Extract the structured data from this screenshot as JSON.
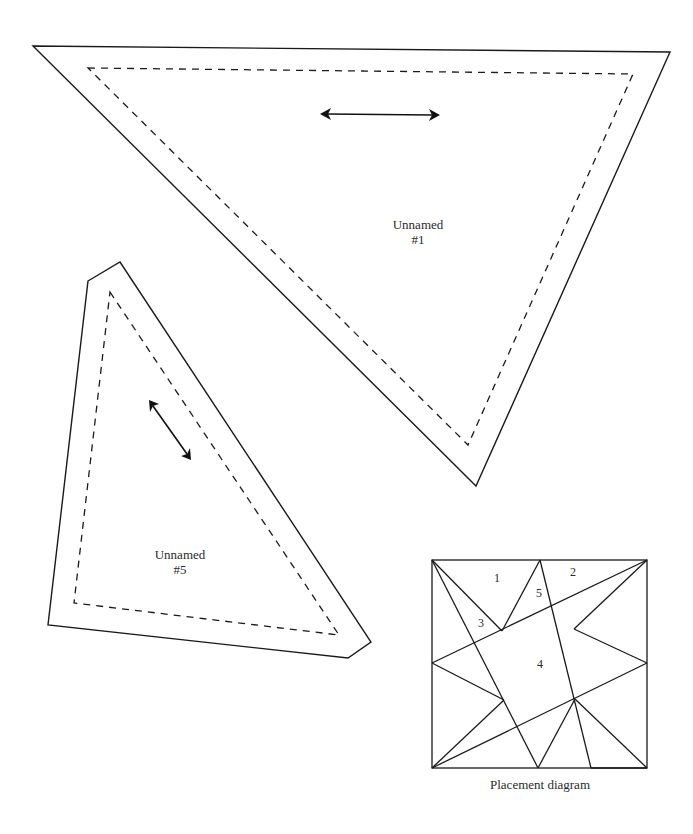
{
  "pieces": [
    {
      "id": "unnamed-1",
      "name": "Unnamed",
      "number": "#1",
      "outer": [
        [
          33,
          46
        ],
        [
          670,
          52
        ],
        [
          476,
          486
        ]
      ],
      "inner": [
        [
          88,
          68
        ],
        [
          633,
          74
        ],
        [
          468,
          445
        ]
      ],
      "grain_arrow": [
        [
          320,
          114
        ],
        [
          440,
          115
        ]
      ],
      "label_pos": [
        418,
        218
      ]
    },
    {
      "id": "unnamed-5",
      "name": "Unnamed",
      "number": "#5",
      "outer": [
        [
          88,
          281
        ],
        [
          120,
          262
        ],
        [
          371,
          642
        ],
        [
          348,
          658
        ],
        [
          48,
          625
        ]
      ],
      "inner": [
        [
          110,
          292
        ],
        [
          339,
          635
        ],
        [
          74,
          603
        ]
      ],
      "grain_arrow": [
        [
          149,
          400
        ],
        [
          191,
          460
        ]
      ],
      "label_pos": [
        180,
        548
      ]
    }
  ],
  "placement_diagram": {
    "caption": "Placement diagram",
    "square": [
      432,
      560,
      647,
      768
    ],
    "numbers": [
      {
        "label": "1",
        "pos": [
          497,
          580
        ]
      },
      {
        "label": "2",
        "pos": [
          573,
          573
        ]
      },
      {
        "label": "3",
        "pos": [
          481,
          624
        ]
      },
      {
        "label": "4",
        "pos": [
          540,
          665
        ]
      },
      {
        "label": "5",
        "pos": [
          539,
          594
        ]
      }
    ]
  }
}
